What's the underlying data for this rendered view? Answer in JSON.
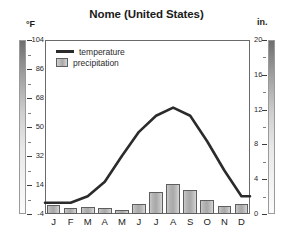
{
  "chart": {
    "title": "Nome (United States)",
    "left_axis_unit": "°F",
    "right_axis_unit": "in.",
    "legend": {
      "temperature_label": "temperature",
      "precipitation_label": "precipitation"
    }
  },
  "chart_data": {
    "type": "line",
    "title": "Nome (United States)",
    "subtitle": "",
    "xlabel": "",
    "ylabel": "°F",
    "y2label": "in.",
    "grid": false,
    "legend_position": "top-left",
    "categories": [
      "J",
      "F",
      "M",
      "A",
      "M",
      "J",
      "J",
      "A",
      "S",
      "O",
      "N",
      "D"
    ],
    "month_names": [
      "January",
      "February",
      "March",
      "April",
      "May",
      "June",
      "July",
      "August",
      "September",
      "October",
      "November",
      "December"
    ],
    "series": [
      {
        "name": "temperature",
        "type": "line",
        "axis": "left",
        "unit": "°F",
        "color": "#2b2b2b",
        "values": [
          3,
          3,
          7,
          16,
          32,
          47,
          57,
          62,
          57,
          41,
          23,
          7
        ]
      },
      {
        "name": "precipitation",
        "type": "bar",
        "axis": "right",
        "unit": "in.",
        "color": "#b0b0b0",
        "values": [
          1.0,
          0.7,
          0.8,
          0.7,
          0.5,
          1.2,
          2.5,
          3.4,
          2.8,
          1.6,
          0.9,
          1.2
        ]
      }
    ],
    "ylim": [
      -4,
      104
    ],
    "yticks": [
      -4,
      14,
      32,
      50,
      68,
      86,
      104
    ],
    "ytick_labels": [
      "-4",
      "14",
      "32",
      "50",
      "68",
      "86",
      "104"
    ],
    "y2lim": [
      0,
      20
    ],
    "y2ticks": [
      0,
      4,
      8,
      12,
      16,
      20
    ],
    "y2tick_labels": [
      "0",
      "4",
      "8",
      "12",
      "16",
      "20"
    ]
  }
}
